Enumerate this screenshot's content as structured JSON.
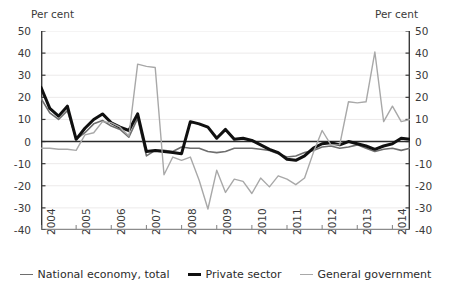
{
  "axes": {
    "unit_label_left": "Per cent",
    "unit_label_right": "Per cent",
    "y_ticks": [
      50,
      40,
      30,
      20,
      10,
      0,
      -10,
      -20,
      -30,
      -40
    ],
    "x_ticks": [
      "2004",
      "2005",
      "2006",
      "2007",
      "2008",
      "2009",
      "2010",
      "2011",
      "2012",
      "2013",
      "2014"
    ]
  },
  "legend": {
    "items": [
      {
        "label": "National economy, total",
        "color": "#6e6e6e"
      },
      {
        "label": "Private sector",
        "color": "#101010"
      },
      {
        "label": "General government",
        "color": "#a8a8a8"
      }
    ]
  },
  "chart_data": {
    "type": "line",
    "title": "",
    "subtitle": "",
    "xlabel": "",
    "ylabel": "Per cent",
    "ylim": [
      -40,
      50
    ],
    "y_ticks": [
      -40,
      -30,
      -20,
      -10,
      0,
      10,
      20,
      30,
      40,
      50
    ],
    "grid": true,
    "legend_position": "bottom",
    "x_tick_labels": [
      "2004",
      "2005",
      "2006",
      "2007",
      "2008",
      "2009",
      "2010",
      "2011",
      "2012",
      "2013",
      "2014"
    ],
    "x": [
      "2004Q1",
      "2004Q2",
      "2004Q3",
      "2004Q4",
      "2005Q1",
      "2005Q2",
      "2005Q3",
      "2005Q4",
      "2006Q1",
      "2006Q2",
      "2006Q3",
      "2006Q4",
      "2007Q1",
      "2007Q2",
      "2007Q3",
      "2007Q4",
      "2008Q1",
      "2008Q2",
      "2008Q3",
      "2008Q4",
      "2009Q1",
      "2009Q2",
      "2009Q3",
      "2009Q4",
      "2010Q1",
      "2010Q2",
      "2010Q3",
      "2010Q4",
      "2011Q1",
      "2011Q2",
      "2011Q3",
      "2011Q4",
      "2012Q1",
      "2012Q2",
      "2012Q3",
      "2012Q4",
      "2013Q1",
      "2013Q2",
      "2013Q3",
      "2013Q4",
      "2014Q1",
      "2014Q2",
      "2014Q3"
    ],
    "series": [
      {
        "name": "National economy, total",
        "color": "#6e6e6e",
        "width": 1.6,
        "values": [
          19.5,
          13.0,
          10.0,
          14.0,
          1.0,
          4.0,
          8.0,
          9.5,
          7.0,
          5.5,
          2.0,
          10.5,
          -6.5,
          -4.0,
          -4.0,
          -4.5,
          -2.5,
          -3.0,
          -3.0,
          -4.5,
          -5.0,
          -4.5,
          -3.0,
          -3.0,
          -3.0,
          -3.5,
          -4.0,
          -5.5,
          -7.0,
          -6.5,
          -5.0,
          -4.0,
          -2.5,
          -2.0,
          -3.0,
          -2.5,
          -1.5,
          -3.0,
          -4.5,
          -3.5,
          -3.0,
          -4.0,
          -3.0
        ]
      },
      {
        "name": "Private sector",
        "color": "#101010",
        "width": 3.0,
        "values": [
          24.5,
          15.0,
          11.5,
          16.0,
          1.0,
          6.0,
          10.0,
          12.5,
          8.5,
          6.5,
          5.0,
          12.5,
          -4.5,
          -4.0,
          -4.5,
          -5.0,
          -5.5,
          9.0,
          8.0,
          6.5,
          1.5,
          5.5,
          1.0,
          1.5,
          0.5,
          -1.5,
          -3.5,
          -5.0,
          -8.0,
          -8.5,
          -6.5,
          -3.0,
          -1.0,
          -0.5,
          -1.5,
          0.0,
          -1.0,
          -2.0,
          -3.5,
          -2.0,
          -1.0,
          1.5,
          1.0
        ]
      },
      {
        "name": "General government",
        "color": "#a8a8a8",
        "width": 1.4,
        "values": [
          -3.0,
          -3.0,
          -3.5,
          -3.5,
          -4.0,
          3.0,
          4.0,
          9.0,
          8.5,
          6.5,
          2.5,
          35.0,
          34.0,
          33.5,
          -15.0,
          -7.0,
          -8.5,
          -7.0,
          -17.5,
          -30.5,
          -13.0,
          -23.0,
          -17.0,
          -18.0,
          -23.5,
          -16.5,
          -20.5,
          -15.5,
          -17.0,
          -19.5,
          -16.5,
          -5.0,
          5.0,
          -1.5,
          -1.5,
          18.0,
          17.5,
          18.0,
          40.5,
          9.0,
          16.0,
          9.0,
          10.0
        ]
      }
    ],
    "annotations": []
  }
}
